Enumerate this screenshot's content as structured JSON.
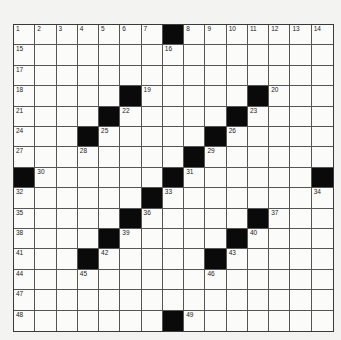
{
  "puzzle": {
    "rows": 15,
    "cols": 15,
    "colors": {
      "black_cell": "#0a0a0a",
      "white_cell": "#fbfbfa",
      "grid_line": "#555555",
      "background": "#f3f3f1"
    },
    "black_cells": [
      [
        0,
        7
      ],
      [
        3,
        5
      ],
      [
        3,
        11
      ],
      [
        4,
        4
      ],
      [
        4,
        10
      ],
      [
        5,
        3
      ],
      [
        5,
        9
      ],
      [
        6,
        8
      ],
      [
        7,
        0
      ],
      [
        7,
        7
      ],
      [
        7,
        14
      ],
      [
        8,
        6
      ],
      [
        9,
        5
      ],
      [
        9,
        11
      ],
      [
        10,
        4
      ],
      [
        10,
        10
      ],
      [
        11,
        3
      ],
      [
        11,
        9
      ],
      [
        14,
        7
      ]
    ],
    "numbers": [
      {
        "r": 0,
        "c": 0,
        "n": "1"
      },
      {
        "r": 0,
        "c": 1,
        "n": "2"
      },
      {
        "r": 0,
        "c": 2,
        "n": "3"
      },
      {
        "r": 0,
        "c": 3,
        "n": "4"
      },
      {
        "r": 0,
        "c": 4,
        "n": "5"
      },
      {
        "r": 0,
        "c": 5,
        "n": "6"
      },
      {
        "r": 0,
        "c": 6,
        "n": "7"
      },
      {
        "r": 0,
        "c": 8,
        "n": "8"
      },
      {
        "r": 0,
        "c": 9,
        "n": "9"
      },
      {
        "r": 0,
        "c": 10,
        "n": "10"
      },
      {
        "r": 0,
        "c": 11,
        "n": "11"
      },
      {
        "r": 0,
        "c": 12,
        "n": "12"
      },
      {
        "r": 0,
        "c": 13,
        "n": "13"
      },
      {
        "r": 0,
        "c": 14,
        "n": "14"
      },
      {
        "r": 1,
        "c": 0,
        "n": "15"
      },
      {
        "r": 1,
        "c": 7,
        "n": "16"
      },
      {
        "r": 2,
        "c": 0,
        "n": "17"
      },
      {
        "r": 3,
        "c": 0,
        "n": "18"
      },
      {
        "r": 3,
        "c": 6,
        "n": "19"
      },
      {
        "r": 3,
        "c": 12,
        "n": "20"
      },
      {
        "r": 4,
        "c": 0,
        "n": "21"
      },
      {
        "r": 4,
        "c": 5,
        "n": "22"
      },
      {
        "r": 4,
        "c": 11,
        "n": "23"
      },
      {
        "r": 5,
        "c": 0,
        "n": "24"
      },
      {
        "r": 5,
        "c": 4,
        "n": "25"
      },
      {
        "r": 5,
        "c": 10,
        "n": "26"
      },
      {
        "r": 6,
        "c": 0,
        "n": "27"
      },
      {
        "r": 6,
        "c": 3,
        "n": "28"
      },
      {
        "r": 6,
        "c": 9,
        "n": "29"
      },
      {
        "r": 7,
        "c": 1,
        "n": "30"
      },
      {
        "r": 7,
        "c": 8,
        "n": "31"
      },
      {
        "r": 8,
        "c": 0,
        "n": "32"
      },
      {
        "r": 8,
        "c": 7,
        "n": "33"
      },
      {
        "r": 8,
        "c": 14,
        "n": "34"
      },
      {
        "r": 9,
        "c": 0,
        "n": "35"
      },
      {
        "r": 9,
        "c": 6,
        "n": "36"
      },
      {
        "r": 9,
        "c": 12,
        "n": "37"
      },
      {
        "r": 10,
        "c": 0,
        "n": "38"
      },
      {
        "r": 10,
        "c": 5,
        "n": "39"
      },
      {
        "r": 10,
        "c": 11,
        "n": "40"
      },
      {
        "r": 11,
        "c": 0,
        "n": "41"
      },
      {
        "r": 11,
        "c": 4,
        "n": "42"
      },
      {
        "r": 11,
        "c": 10,
        "n": "43"
      },
      {
        "r": 12,
        "c": 0,
        "n": "44"
      },
      {
        "r": 12,
        "c": 3,
        "n": "45"
      },
      {
        "r": 12,
        "c": 9,
        "n": "46"
      },
      {
        "r": 13,
        "c": 0,
        "n": "47"
      },
      {
        "r": 14,
        "c": 0,
        "n": "48"
      },
      {
        "r": 14,
        "c": 8,
        "n": "49"
      }
    ]
  }
}
